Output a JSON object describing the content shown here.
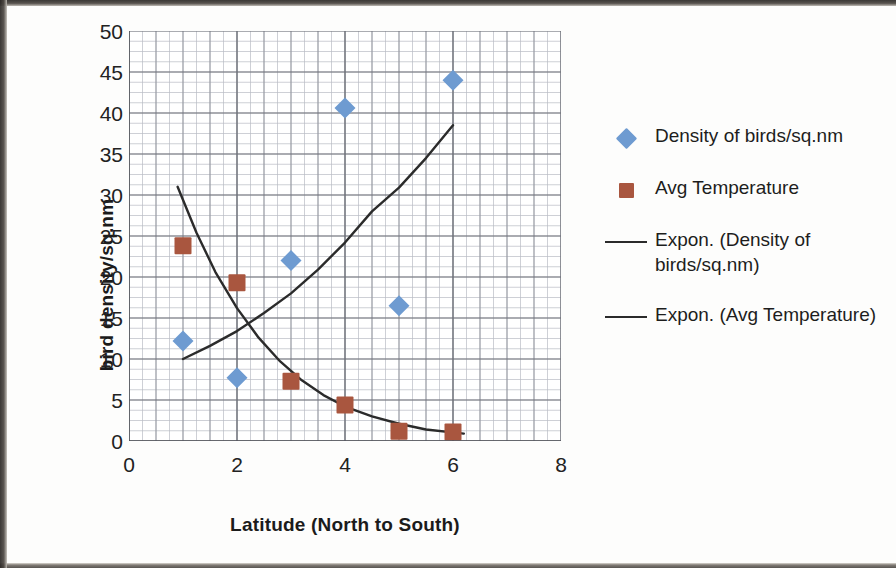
{
  "axes": {
    "ytitle": "bird density/sq.nm",
    "xtitle": "Latitude (North to South)",
    "yticks": [
      "0",
      "5",
      "10",
      "15",
      "20",
      "25",
      "30",
      "35",
      "40",
      "45",
      "50"
    ],
    "xticks": [
      "0",
      "2",
      "4",
      "6",
      "8"
    ]
  },
  "legend": {
    "items": [
      {
        "label": "Density of birds/sq.nm",
        "key": "diamond-marker-icon",
        "color": "#6e9bd1"
      },
      {
        "label": "Avg Temperature",
        "key": "square-marker-icon",
        "color": "#a9563f"
      },
      {
        "label": "Expon. (Density of birds/sq.nm)",
        "key": "trendline-icon",
        "color": "#2b2b2b"
      },
      {
        "label": "Expon. (Avg Temperature)",
        "key": "trendline-icon",
        "color": "#2b2b2b"
      }
    ]
  },
  "chart_data": {
    "type": "scatter",
    "title": "",
    "xlabel": "Latitude (North to South)",
    "ylabel": "bird density/sq.nm",
    "xlim": [
      0,
      8
    ],
    "ylim": [
      0,
      50
    ],
    "xtick_step": 2,
    "ytick_step": 5,
    "x_minor_step": 0.25,
    "y_minor_step": 1.25,
    "grid": true,
    "legend_position": "right",
    "series": [
      {
        "name": "Density of birds/sq.nm",
        "marker": "diamond",
        "color": "#6e9bd1",
        "x": [
          1,
          2,
          3,
          4,
          5,
          6
        ],
        "y": [
          12.2,
          7.7,
          22.0,
          40.6,
          16.5,
          44.0
        ]
      },
      {
        "name": "Avg Temperature",
        "marker": "square",
        "color": "#a9563f",
        "x": [
          1,
          2,
          3,
          4,
          5,
          6
        ],
        "y": [
          23.8,
          19.3,
          7.3,
          4.4,
          1.2,
          1.1
        ]
      }
    ],
    "trendlines": [
      {
        "name": "Expon. (Density of birds/sq.nm)",
        "type": "exponential",
        "color": "#2b2b2b",
        "x_range": [
          1.0,
          6.0
        ],
        "y_range": [
          10.0,
          38.5
        ],
        "points": [
          [
            1.0,
            10.0
          ],
          [
            1.5,
            11.6
          ],
          [
            2.0,
            13.4
          ],
          [
            2.5,
            15.6
          ],
          [
            3.0,
            18.0
          ],
          [
            3.5,
            20.9
          ],
          [
            4.0,
            24.2
          ],
          [
            4.5,
            28.0
          ],
          [
            5.0,
            30.9
          ],
          [
            5.5,
            34.5
          ],
          [
            6.0,
            38.5
          ]
        ]
      },
      {
        "name": "Expon. (Avg Temperature)",
        "type": "exponential",
        "color": "#2b2b2b",
        "x_range": [
          0.9,
          6.2
        ],
        "y_range": [
          31.0,
          0.9
        ],
        "points": [
          [
            0.9,
            31.0
          ],
          [
            1.25,
            25.4
          ],
          [
            1.6,
            20.6
          ],
          [
            2.0,
            16.2
          ],
          [
            2.4,
            12.6
          ],
          [
            2.8,
            9.7
          ],
          [
            3.2,
            7.4
          ],
          [
            3.6,
            5.6
          ],
          [
            4.0,
            4.2
          ],
          [
            4.5,
            3.0
          ],
          [
            5.0,
            2.1
          ],
          [
            5.5,
            1.4
          ],
          [
            6.2,
            0.9
          ]
        ]
      }
    ]
  }
}
